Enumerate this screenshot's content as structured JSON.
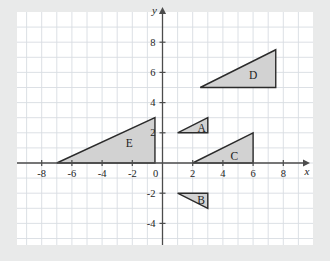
{
  "figure": {
    "title": "",
    "background_color": "#e9eaea",
    "plot_background_color": "#ffffff",
    "grid_color": "#d8dde2",
    "axis_color": "#4c4c4c",
    "shape_fill_color": "#d2d2d2",
    "shape_stroke_color": "#2b2b2b"
  },
  "axes": {
    "x_axis_label": "x",
    "y_axis_label": "y",
    "x_ticks": [
      "-8",
      "-6",
      "-4",
      "-2",
      "0",
      "2",
      "4",
      "6",
      "8"
    ],
    "x_tick_values": [
      -8,
      -6,
      -4,
      -2,
      0,
      2,
      4,
      6,
      8
    ],
    "y_ticks": [
      "8",
      "6",
      "4",
      "2",
      "-2",
      "-4"
    ],
    "y_tick_values": [
      8,
      6,
      4,
      2,
      -2,
      -4
    ],
    "origin_label": "0",
    "xlim": [
      -9,
      9
    ],
    "ylim": [
      -5,
      9
    ],
    "grid": true,
    "grid_step": 1
  },
  "chart_data": {
    "type": "scatter",
    "title": "",
    "xlabel": "x",
    "ylabel": "y",
    "xlim": [
      -9,
      9
    ],
    "ylim": [
      -5,
      9
    ],
    "grid": true,
    "legend": "none",
    "shapes": [
      {
        "label": "A",
        "kind": "right-triangle",
        "vertices": [
          [
            1,
            2
          ],
          [
            3,
            2
          ],
          [
            3,
            3
          ]
        ],
        "label_position": [
          2.6,
          2.35
        ]
      },
      {
        "label": "B",
        "kind": "right-triangle",
        "vertices": [
          [
            1,
            -2
          ],
          [
            3,
            -2
          ],
          [
            3,
            -3
          ]
        ],
        "label_position": [
          2.55,
          -2.45
        ]
      },
      {
        "label": "C",
        "kind": "right-triangle",
        "vertices": [
          [
            2,
            0
          ],
          [
            6,
            0
          ],
          [
            6,
            2
          ]
        ],
        "label_position": [
          4.75,
          0.45
        ]
      },
      {
        "label": "D",
        "kind": "right-triangle",
        "vertices": [
          [
            2.5,
            5
          ],
          [
            7.5,
            5
          ],
          [
            7.5,
            7.5
          ]
        ],
        "label_position": [
          6.0,
          5.85
        ]
      },
      {
        "label": "E",
        "kind": "right-triangle",
        "vertices": [
          [
            -7,
            0
          ],
          [
            -0.5,
            0
          ],
          [
            -0.5,
            3
          ]
        ],
        "label_position": [
          -2.2,
          1.35
        ]
      }
    ]
  }
}
